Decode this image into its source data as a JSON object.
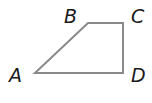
{
  "figure": {
    "shape": "trapezoid",
    "stroke_color": "#8a8a8a",
    "label_color": "#1a1a1a",
    "vertices": [
      {
        "name": "A",
        "x": 35,
        "y": 73,
        "label_x": 9,
        "label_y": 82
      },
      {
        "name": "B",
        "x": 88,
        "y": 23,
        "label_x": 64,
        "label_y": 23
      },
      {
        "name": "C",
        "x": 123,
        "y": 23,
        "label_x": 131,
        "label_y": 23
      },
      {
        "name": "D",
        "x": 123,
        "y": 73,
        "label_x": 131,
        "label_y": 82
      }
    ]
  }
}
